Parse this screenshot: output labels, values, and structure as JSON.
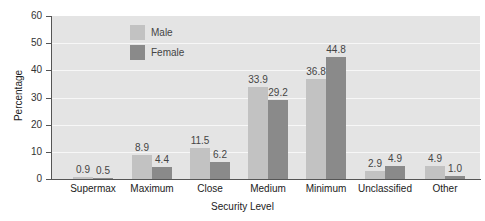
{
  "chart_data": {
    "type": "bar",
    "title": "",
    "xlabel": "Security Level",
    "ylabel": "Percentage",
    "ylim": [
      0,
      60
    ],
    "yticks": [
      0,
      10,
      20,
      30,
      40,
      50,
      60
    ],
    "grid": true,
    "legend_position": "top-left inside",
    "categories": [
      "Supermax",
      "Maximum",
      "Close",
      "Medium",
      "Minimum",
      "Unclassified",
      "Other"
    ],
    "series": [
      {
        "name": "Male",
        "color": "#c2c2c2",
        "values": [
          0.9,
          8.9,
          11.5,
          33.9,
          36.8,
          2.9,
          4.9
        ]
      },
      {
        "name": "Female",
        "color": "#8a8a8a",
        "values": [
          0.5,
          4.4,
          6.2,
          29.2,
          44.8,
          4.9,
          1.0
        ]
      }
    ]
  },
  "labels": {
    "xlabel": "Security Level",
    "ylabel": "Percentage",
    "legend_male": "Male",
    "legend_female": "Female"
  }
}
